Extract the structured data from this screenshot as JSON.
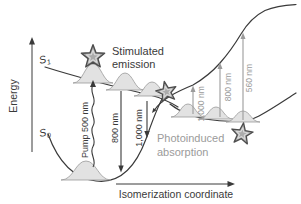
{
  "figure": {
    "axes": {
      "y_label": "Energy",
      "x_label": "Isomerization coordinate"
    },
    "states": {
      "s1": {
        "symbol": "S",
        "subscript": "1"
      },
      "s0": {
        "symbol": "S",
        "subscript": "0"
      }
    },
    "annotations": {
      "stimulated_emission": {
        "line1": "Stimulated",
        "line2": "emission"
      },
      "photoinduced_absorption": {
        "line1": "Photoinduced",
        "line2": "absorption"
      }
    },
    "arrows": {
      "pump": {
        "label": "Pump 500 nm",
        "direction": "up",
        "style": "wavy-black"
      },
      "stimulated_emission": [
        {
          "label": "800 nm",
          "direction": "down",
          "style": "straight-black"
        },
        {
          "label": "1,000 nm",
          "direction": "down",
          "style": "straight-black"
        }
      ],
      "photoinduced_absorption": [
        {
          "label": "1,000 nm",
          "direction": "up",
          "style": "straight-gray"
        },
        {
          "label": "800 nm",
          "direction": "up",
          "style": "straight-gray"
        },
        {
          "label": "560 nm",
          "direction": "up",
          "style": "straight-gray"
        }
      ]
    },
    "icons": {
      "stars": [
        "star-franck-condon",
        "star-conical-intersection",
        "star-product"
      ]
    },
    "colors": {
      "ink": "#3a3a3a",
      "gray_annotation": "#9b9b9b",
      "wavepacket_fill": "#e2e2e2",
      "wavepacket_stroke": "#9b9b9b",
      "star_fill": "#ababab",
      "star_stroke": "#4d4d4d",
      "star_inner_stroke": "#d9d9d9",
      "background": "#ffffff"
    }
  }
}
